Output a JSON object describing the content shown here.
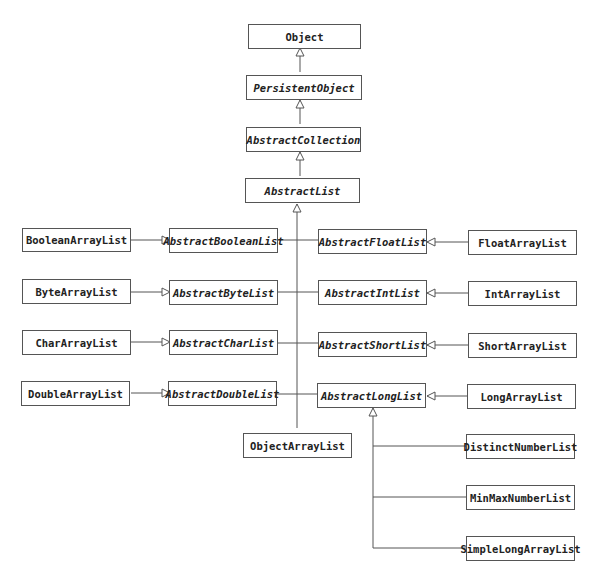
{
  "diagram": {
    "type": "class-hierarchy",
    "nodes": {
      "object": {
        "label": "Object",
        "abstract": false
      },
      "persistent_object": {
        "label": "PersistentObject",
        "abstract": true
      },
      "abstract_collection": {
        "label": "AbstractCollection",
        "abstract": true
      },
      "abstract_list": {
        "label": "AbstractList",
        "abstract": true
      },
      "boolean_array_list": {
        "label": "BooleanArrayList",
        "abstract": false
      },
      "abstract_boolean_list": {
        "label": "AbstractBooleanList",
        "abstract": true
      },
      "abstract_float_list": {
        "label": "AbstractFloatList",
        "abstract": true
      },
      "float_array_list": {
        "label": "FloatArrayList",
        "abstract": false
      },
      "byte_array_list": {
        "label": "ByteArrayList",
        "abstract": false
      },
      "abstract_byte_list": {
        "label": "AbstractByteList",
        "abstract": true
      },
      "abstract_int_list": {
        "label": "AbstractIntList",
        "abstract": true
      },
      "int_array_list": {
        "label": "IntArrayList",
        "abstract": false
      },
      "char_array_list": {
        "label": "CharArrayList",
        "abstract": false
      },
      "abstract_char_list": {
        "label": "AbstractCharList",
        "abstract": true
      },
      "abstract_short_list": {
        "label": "AbstractShortList",
        "abstract": true
      },
      "short_array_list": {
        "label": "ShortArrayList",
        "abstract": false
      },
      "double_array_list": {
        "label": "DoubleArrayList",
        "abstract": false
      },
      "abstract_double_list": {
        "label": "AbstractDoubleList",
        "abstract": true
      },
      "abstract_long_list": {
        "label": "AbstractLongList",
        "abstract": true
      },
      "long_array_list": {
        "label": "LongArrayList",
        "abstract": false
      },
      "object_array_list": {
        "label": "ObjectArrayList",
        "abstract": false
      },
      "distinct_number_list": {
        "label": "DistinctNumberList",
        "abstract": false
      },
      "min_max_number_list": {
        "label": "MinMaxNumberList",
        "abstract": false
      },
      "simple_long_array_list": {
        "label": "SimpleLongArrayList",
        "abstract": false
      }
    },
    "edges": [
      {
        "from": "PersistentObject",
        "to": "Object",
        "kind": "inheritance"
      },
      {
        "from": "AbstractCollection",
        "to": "PersistentObject",
        "kind": "inheritance"
      },
      {
        "from": "AbstractList",
        "to": "AbstractCollection",
        "kind": "inheritance"
      },
      {
        "from": "AbstractBooleanList",
        "to": "AbstractList",
        "kind": "inheritance"
      },
      {
        "from": "AbstractByteList",
        "to": "AbstractList",
        "kind": "inheritance"
      },
      {
        "from": "AbstractCharList",
        "to": "AbstractList",
        "kind": "inheritance"
      },
      {
        "from": "AbstractDoubleList",
        "to": "AbstractList",
        "kind": "inheritance"
      },
      {
        "from": "AbstractFloatList",
        "to": "AbstractList",
        "kind": "inheritance"
      },
      {
        "from": "AbstractIntList",
        "to": "AbstractList",
        "kind": "inheritance"
      },
      {
        "from": "AbstractShortList",
        "to": "AbstractList",
        "kind": "inheritance"
      },
      {
        "from": "AbstractLongList",
        "to": "AbstractList",
        "kind": "inheritance"
      },
      {
        "from": "ObjectArrayList",
        "to": "AbstractList",
        "kind": "inheritance"
      },
      {
        "from": "BooleanArrayList",
        "to": "AbstractBooleanList",
        "kind": "inheritance"
      },
      {
        "from": "ByteArrayList",
        "to": "AbstractByteList",
        "kind": "inheritance"
      },
      {
        "from": "CharArrayList",
        "to": "AbstractCharList",
        "kind": "inheritance"
      },
      {
        "from": "DoubleArrayList",
        "to": "AbstractDoubleList",
        "kind": "inheritance"
      },
      {
        "from": "FloatArrayList",
        "to": "AbstractFloatList",
        "kind": "inheritance"
      },
      {
        "from": "IntArrayList",
        "to": "AbstractIntList",
        "kind": "inheritance"
      },
      {
        "from": "ShortArrayList",
        "to": "AbstractShortList",
        "kind": "inheritance"
      },
      {
        "from": "LongArrayList",
        "to": "AbstractLongList",
        "kind": "inheritance"
      },
      {
        "from": "DistinctNumberList",
        "to": "AbstractLongList",
        "kind": "inheritance"
      },
      {
        "from": "MinMaxNumberList",
        "to": "AbstractLongList",
        "kind": "inheritance"
      },
      {
        "from": "SimpleLongArrayList",
        "to": "AbstractLongList",
        "kind": "inheritance"
      }
    ],
    "colors": {
      "stroke": "#555555",
      "text": "#222222",
      "background": "#ffffff"
    }
  }
}
